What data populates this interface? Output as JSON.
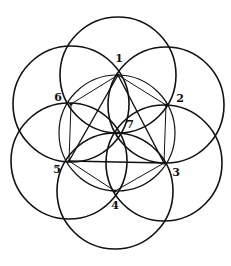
{
  "diagram": {
    "title": "",
    "stroke_color": "#111111",
    "background": "#ffffff",
    "circle_radius": 58,
    "points": [
      {
        "id": "1",
        "label": "1",
        "x": 118,
        "y": 75,
        "lx": 119,
        "ly": 62
      },
      {
        "id": "2",
        "label": "2",
        "x": 166,
        "y": 105,
        "lx": 180,
        "ly": 102
      },
      {
        "id": "3",
        "label": "3",
        "x": 164,
        "y": 163,
        "lx": 176,
        "ly": 176
      },
      {
        "id": "4",
        "label": "4",
        "x": 115,
        "y": 191,
        "lx": 115,
        "ly": 209
      },
      {
        "id": "5",
        "label": "5",
        "x": 69,
        "y": 161,
        "lx": 57,
        "ly": 173
      },
      {
        "id": "6",
        "label": "6",
        "x": 71,
        "y": 104,
        "lx": 58,
        "ly": 101
      },
      {
        "id": "7",
        "label": "7",
        "x": 117,
        "y": 133,
        "lx": 130,
        "ly": 128
      }
    ],
    "circles": [
      "1",
      "2",
      "3",
      "4",
      "5",
      "6",
      "7"
    ],
    "hexagon_edges": [
      [
        "1",
        "2"
      ],
      [
        "2",
        "3"
      ],
      [
        "3",
        "4"
      ],
      [
        "4",
        "5"
      ],
      [
        "5",
        "6"
      ],
      [
        "6",
        "1"
      ]
    ],
    "triangle_edges": [
      [
        "1",
        "3"
      ],
      [
        "3",
        "5"
      ],
      [
        "5",
        "1"
      ]
    ]
  }
}
